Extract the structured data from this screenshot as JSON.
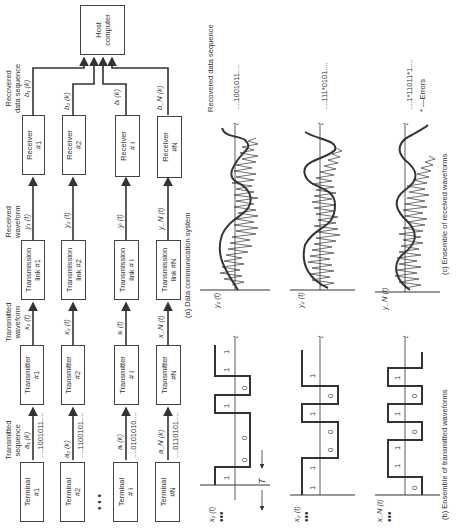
{
  "figure": {
    "orientation": "rotated-90-ccw",
    "captions": {
      "a": "(a) Data communication system",
      "b": "(b) Ensemble of transmitted waveforms",
      "c": "(c) Ensemble of received waveforms"
    },
    "column_headers": {
      "transmitted_sequence": [
        "Transmitted",
        "sequence",
        "a₁ (k)"
      ],
      "transmitted_waveform": [
        "Transmitted",
        "waveform",
        "x₁ (t)"
      ],
      "received_waveform": [
        "Received",
        "waveform",
        "y₁ (t)"
      ],
      "recovered_data_sequence": [
        "Recovered",
        "data sequence",
        "b₁ (k)"
      ]
    },
    "host": {
      "label_line1": "Host",
      "label_line2": "computer"
    },
    "chains": [
      {
        "id": "1",
        "terminal": [
          "Terminal",
          "#1"
        ],
        "transmitter": [
          "Transmitter",
          "#1"
        ],
        "link": [
          "Transmission",
          "link #1"
        ],
        "receiver": [
          "Receiver",
          "#1"
        ],
        "a_label": "a₁ (k)",
        "sequence": "....1001011....",
        "x_label": "x₁ (t)",
        "y_label": "y₁ (t)",
        "b_label": "b₁ (k)"
      },
      {
        "id": "2",
        "terminal": [
          "Terminal",
          "#2"
        ],
        "transmitter": [
          "Transmitter",
          "#2"
        ],
        "link": [
          "Transmission",
          "link #2"
        ],
        "receiver": [
          "Receiver",
          "#2"
        ],
        "a_label": "a₂ (k)",
        "sequence": "....1100101....",
        "x_label": "x₂ (t)",
        "y_label": "y₂ (t)",
        "b_label": "b₂ (k)"
      },
      {
        "id": "i",
        "terminal": [
          "Terminal",
          "# i"
        ],
        "transmitter": [
          "Transmitter",
          "# i"
        ],
        "link": [
          "Transmission",
          "link # i"
        ],
        "receiver": [
          "Receiver",
          "# i"
        ],
        "a_label": "aᵢ (k)",
        "sequence": "....0101010....",
        "x_label": "xᵢ (t)",
        "y_label": "yᵢ (t)",
        "b_label": "bᵢ (k)"
      },
      {
        "id": "N",
        "terminal": [
          "Terminal",
          "#N"
        ],
        "transmitter": [
          "Transmitter",
          "#N"
        ],
        "link": [
          "Transmission",
          "link #N"
        ],
        "receiver": [
          "Receiver",
          "#N"
        ],
        "a_label": "a_N (k)",
        "sequence": "....0110101....",
        "x_label": "x_N (t)",
        "y_label": "y_N (t)",
        "b_label": "b_N (k)"
      }
    ],
    "ellipsis": "• • •",
    "transmitted_waveforms": [
      {
        "label": "x₁ (t)",
        "bits": [
          "1",
          "0",
          "0",
          "1",
          "0",
          "1",
          "1"
        ],
        "dots": "•••",
        "axis": "t"
      },
      {
        "label": "x₂ (t)",
        "bits": [
          "1",
          "1",
          "0",
          "0",
          "1",
          "0",
          "1"
        ],
        "dots": "•••",
        "axis": "t"
      },
      {
        "label": "x_N (t)",
        "bits": [
          "0",
          "1",
          "1",
          "0",
          "1",
          "0",
          "1"
        ],
        "dots": "•••",
        "axis": "t"
      }
    ],
    "bit_period_label": "T",
    "received_waveforms": [
      {
        "label": "y₁ (t)",
        "recovered": "....1001011....",
        "axis": "t"
      },
      {
        "label": "y₂ (t)",
        "recovered": "....111*0101....",
        "axis": "t"
      },
      {
        "label": "y_N (t)",
        "recovered": "....1*11011*1....",
        "axis": "t"
      }
    ],
    "recovered_header": "Recovered data sequence",
    "errors_note": "* —Errors"
  }
}
